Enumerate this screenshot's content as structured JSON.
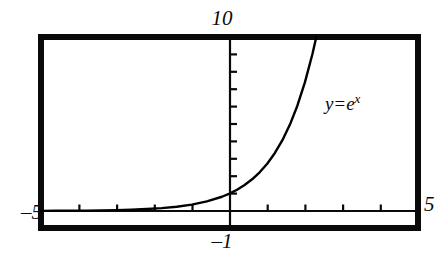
{
  "chart_data": {
    "type": "line",
    "title": "",
    "subtitle": "",
    "xlabel": "",
    "ylabel": "",
    "xlim": [
      -5,
      5
    ],
    "ylim": [
      -1,
      10
    ],
    "grid": false,
    "legend_position": "inline-annotation",
    "annotations": [
      {
        "text": "y = e^x",
        "text_parts": {
          "lhs": "y",
          "operator": "=",
          "base": "e",
          "exponent": "x"
        },
        "x": 2.5,
        "y": 6.2
      }
    ],
    "axis_corner_labels": {
      "top": "10",
      "left": "–5",
      "right": "5",
      "bottom": "–1"
    },
    "x_ticks": [
      -4,
      -3,
      -2,
      -1,
      1,
      2,
      3,
      4
    ],
    "x_tick_labels": [],
    "y_ticks": [
      1,
      2,
      3,
      4,
      5,
      6,
      7,
      8,
      9
    ],
    "y_tick_labels": [],
    "series": [
      {
        "name": "y = e^x",
        "color": "#000000",
        "x": [
          -5.0,
          -4.6,
          -4.2,
          -3.8,
          -3.4,
          -3.0,
          -2.6,
          -2.2,
          -1.8,
          -1.4,
          -1.0,
          -0.6,
          -0.2,
          0.0,
          0.2,
          0.4,
          0.6,
          0.8,
          1.0,
          1.2,
          1.4,
          1.6,
          1.8,
          2.0,
          2.2,
          2.3026
        ],
        "y": [
          0.0067,
          0.0101,
          0.015,
          0.0224,
          0.0334,
          0.0498,
          0.0743,
          0.1108,
          0.1653,
          0.2466,
          0.3679,
          0.5488,
          0.8187,
          1.0,
          1.2214,
          1.4918,
          1.8221,
          2.2255,
          2.7183,
          3.3201,
          4.0552,
          4.953,
          6.0496,
          7.3891,
          9.025,
          10.0
        ]
      }
    ]
  },
  "figure": {
    "frame_color": "#0a0a0a",
    "curve_color": "#0a0a0a",
    "background": "#ffffff",
    "top_label": "10",
    "left_label": "–5",
    "right_label": "5",
    "bottom_label": "–1",
    "equation": {
      "lhs": "y",
      "operator": "=",
      "base": "e",
      "exponent": "x"
    }
  }
}
